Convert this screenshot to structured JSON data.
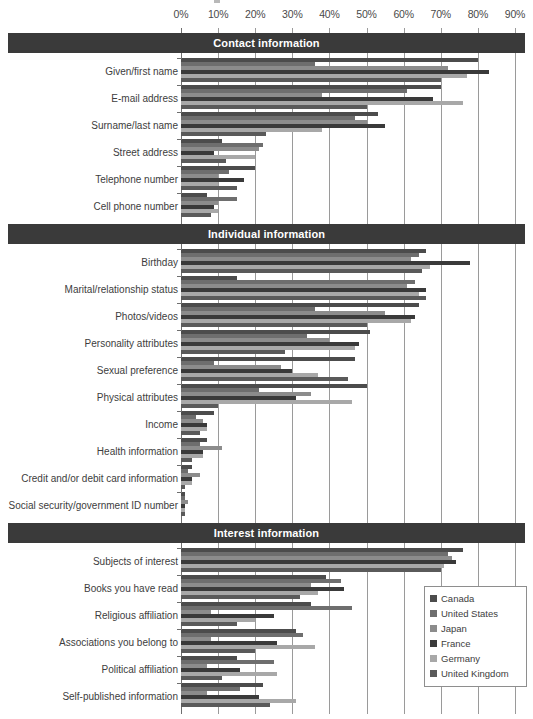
{
  "chart_data": {
    "type": "bar",
    "orientation": "horizontal",
    "title": "",
    "xlabel": "",
    "ylabel": "",
    "xlim": [
      0,
      90
    ],
    "xticks": [
      "0%",
      "10%",
      "20%",
      "30%",
      "40%",
      "50%",
      "60%",
      "70%",
      "80%",
      "90%"
    ],
    "xtick_values": [
      0,
      10,
      20,
      30,
      40,
      50,
      60,
      70,
      80,
      90
    ],
    "grid": true,
    "legend_position": "bottom-right",
    "series": [
      {
        "name": "Canada",
        "color": "#4c4c4c"
      },
      {
        "name": "United States",
        "color": "#6e6e6e"
      },
      {
        "name": "Japan",
        "color": "#8c8c8c"
      },
      {
        "name": "France",
        "color": "#3a3a3a"
      },
      {
        "name": "Germany",
        "color": "#a8a8a8"
      },
      {
        "name": "United Kingdom",
        "color": "#5a5a5a"
      }
    ],
    "sections": [
      {
        "title": "Contact information",
        "categories": [
          {
            "label": "Given/first name",
            "values": [
              80,
              36,
              72,
              83,
              77,
              70
            ]
          },
          {
            "label": "E-mail address",
            "values": [
              70,
              61,
              38,
              68,
              76,
              50
            ]
          },
          {
            "label": "Surname/last name",
            "values": [
              53,
              47,
              50,
              55,
              38,
              23
            ]
          },
          {
            "label": "Street address",
            "values": [
              11,
              22,
              21,
              9,
              20,
              12
            ]
          },
          {
            "label": "Telephone number",
            "values": [
              20,
              13,
              10,
              17,
              10,
              15
            ]
          },
          {
            "label": "Cell phone number",
            "values": [
              7,
              15,
              10,
              9,
              10,
              8
            ]
          }
        ]
      },
      {
        "title": "Individual information",
        "categories": [
          {
            "label": "Birthday",
            "values": [
              66,
              64,
              62,
              78,
              67,
              65
            ]
          },
          {
            "label": "Marital/relationship status",
            "values": [
              15,
              63,
              61,
              66,
              64,
              66
            ]
          },
          {
            "label": "Photos/videos",
            "values": [
              64,
              36,
              55,
              63,
              62,
              50
            ]
          },
          {
            "label": "Personality attributes",
            "values": [
              51,
              34,
              40,
              48,
              47,
              28
            ]
          },
          {
            "label": "Sexual preference",
            "values": [
              47,
              9,
              27,
              30,
              37,
              45
            ]
          },
          {
            "label": "Physical attributes",
            "values": [
              50,
              21,
              35,
              31,
              46,
              10
            ]
          },
          {
            "label": "Income",
            "values": [
              9,
              4,
              6,
              7,
              7,
              5
            ]
          },
          {
            "label": "Health information",
            "values": [
              7,
              5,
              11,
              6,
              6,
              3
            ]
          },
          {
            "label": "Credit and/or debit card information",
            "values": [
              3,
              2,
              5,
              3,
              3,
              1
            ]
          },
          {
            "label": "Social security/government ID number",
            "values": [
              1,
              1,
              2,
              1,
              1,
              1
            ]
          }
        ]
      },
      {
        "title": "Interest information",
        "categories": [
          {
            "label": "Subjects of interest",
            "values": [
              76,
              72,
              73,
              74,
              71,
              70
            ]
          },
          {
            "label": "Books you have read",
            "values": [
              39,
              43,
              35,
              44,
              37,
              32
            ]
          },
          {
            "label": "Religious affiliation",
            "values": [
              35,
              46,
              8,
              25,
              20,
              15
            ]
          },
          {
            "label": "Associations you belong to",
            "values": [
              31,
              33,
              8,
              26,
              36,
              20
            ]
          },
          {
            "label": "Political affiliation",
            "values": [
              15,
              25,
              7,
              16,
              26,
              11
            ]
          },
          {
            "label": "Self-published information",
            "values": [
              22,
              16,
              7,
              21,
              31,
              24
            ]
          }
        ]
      }
    ]
  },
  "legend": {
    "items": [
      {
        "label": "Canada",
        "color": "#4c4c4c"
      },
      {
        "label": "United States",
        "color": "#6e6e6e"
      },
      {
        "label": "Japan",
        "color": "#8c8c8c"
      },
      {
        "label": "France",
        "color": "#3a3a3a"
      },
      {
        "label": "Germany",
        "color": "#a8a8a8"
      },
      {
        "label": "United Kingdom",
        "color": "#5a5a5a"
      }
    ]
  }
}
